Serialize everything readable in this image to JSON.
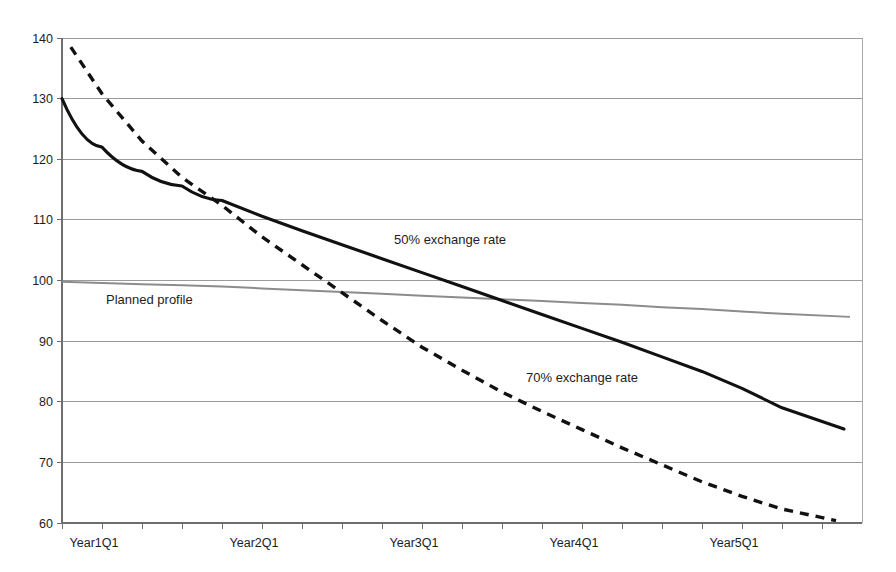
{
  "chart_data": {
    "type": "line",
    "title": "",
    "subtitle": "",
    "xlabel": "",
    "ylabel": "",
    "ylim": [
      60,
      140
    ],
    "yticks": [
      60,
      70,
      80,
      90,
      100,
      110,
      120,
      130,
      140
    ],
    "ytick_labels": [
      "60",
      "70",
      "80",
      "90",
      "100",
      "110",
      "120",
      "130",
      "140"
    ],
    "grid": "horizontal",
    "legend": "inline-annotations",
    "x_categories": [
      "Year1Q1",
      "Year1Q2",
      "Year1Q3",
      "Year1Q4",
      "Year2Q1",
      "Year2Q2",
      "Year2Q3",
      "Year2Q4",
      "Year3Q1",
      "Year3Q2",
      "Year3Q3",
      "Year3Q4",
      "Year4Q1",
      "Year4Q2",
      "Year4Q3",
      "Year4Q4",
      "Year5Q1",
      "Year5Q2",
      "Year5Q3",
      "Year5Q4"
    ],
    "xtick_labels": [
      "Year1Q1",
      "Year2Q1",
      "Year3Q1",
      "Year4Q1",
      "Year5Q1"
    ],
    "xtick_label_indices": [
      0,
      4,
      8,
      12,
      16
    ],
    "series": [
      {
        "name": "Planned profile",
        "style": "solid-thin-gray",
        "color": "#8c8c8c",
        "annotation": "Planned profile",
        "annotation_x_index": 1.1,
        "annotation_y": 96.2,
        "x_indices": [
          0,
          1,
          2,
          3,
          4,
          5,
          6,
          7,
          8,
          9,
          10,
          11,
          12,
          13,
          14,
          15,
          16,
          17,
          18,
          19.7
        ],
        "values": [
          99.8,
          99.6,
          99.4,
          99.2,
          99.0,
          98.7,
          98.4,
          98.1,
          97.8,
          97.5,
          97.2,
          96.9,
          96.6,
          96.3,
          96.0,
          95.6,
          95.3,
          94.9,
          94.5,
          94.0
        ]
      },
      {
        "name": "50% exchange rate",
        "style": "solid-thick-black",
        "color": "#111111",
        "annotation": "50% exchange rate",
        "annotation_x_index": 8.3,
        "annotation_y": 106.0,
        "x_indices": [
          0,
          1,
          2,
          3,
          4,
          5,
          6,
          7,
          8,
          9,
          10,
          11,
          12,
          13,
          14,
          15,
          16,
          17,
          18,
          19.55
        ],
        "values": [
          130.0,
          122.0,
          118.0,
          115.6,
          113.2,
          110.6,
          108.2,
          105.9,
          103.6,
          101.3,
          99.0,
          96.7,
          94.4,
          92.1,
          89.8,
          87.4,
          85.0,
          82.2,
          79.0,
          75.5
        ]
      },
      {
        "name": "70% exchange rate",
        "style": "dashed-thick-black",
        "color": "#111111",
        "annotation": "70% exchange rate",
        "annotation_x_index": 11.6,
        "annotation_y": 83.2,
        "x_indices": [
          0.22,
          1,
          2,
          3,
          4,
          5,
          6,
          7,
          8,
          9,
          10,
          11,
          12,
          13,
          14,
          15,
          16,
          17,
          18,
          19.35
        ],
        "values": [
          138.5,
          130.8,
          123.0,
          117.0,
          112.4,
          107.2,
          102.6,
          98.0,
          93.4,
          89.0,
          85.2,
          81.6,
          78.4,
          75.4,
          72.4,
          69.6,
          66.8,
          64.4,
          62.3,
          60.4
        ]
      }
    ]
  },
  "plot_geometry": {
    "left": 62,
    "right": 862,
    "top": 38,
    "bottom": 523,
    "x_step": 40
  }
}
